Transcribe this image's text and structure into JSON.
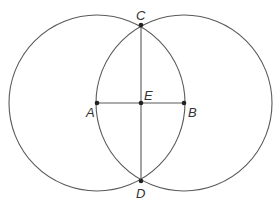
{
  "diagram": {
    "circles": [
      {
        "name": "circle-centered-A",
        "cx": 97,
        "cy": 103,
        "r": 88
      },
      {
        "name": "circle-centered-B",
        "cx": 184,
        "cy": 103,
        "r": 88
      }
    ],
    "segments": [
      {
        "name": "segment-AB",
        "from": "A",
        "to": "B"
      },
      {
        "name": "segment-CD",
        "from": "C",
        "to": "D"
      }
    ],
    "points": {
      "A": {
        "label": "A",
        "x": 97,
        "y": 103,
        "lx": 86,
        "ly": 117
      },
      "B": {
        "label": "B",
        "x": 184,
        "y": 103,
        "lx": 188,
        "ly": 117
      },
      "C": {
        "label": "C",
        "x": 141,
        "y": 25,
        "lx": 136,
        "ly": 20
      },
      "D": {
        "label": "D",
        "x": 141,
        "y": 181,
        "lx": 136,
        "ly": 198
      },
      "E": {
        "label": "E",
        "x": 141,
        "y": 103,
        "lx": 144,
        "ly": 100
      }
    },
    "colors": {
      "stroke": "#5a5a5a",
      "point": "#222222",
      "label": "#333333",
      "background": "#ffffff"
    }
  }
}
